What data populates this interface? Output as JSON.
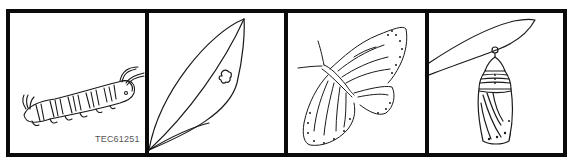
{
  "strip": {
    "panels": [
      {
        "subject": "caterpillar",
        "label": "TEC61251"
      },
      {
        "subject": "leaf-with-egg"
      },
      {
        "subject": "butterfly"
      },
      {
        "subject": "chrysalis"
      }
    ],
    "colors": {
      "border": "#0a0a0a",
      "background": "#ffffff",
      "line": "#1a1a1a"
    }
  }
}
